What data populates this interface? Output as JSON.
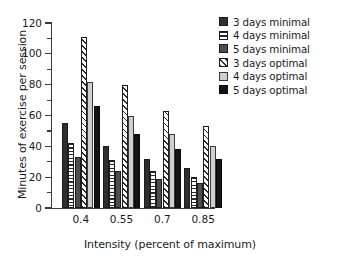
{
  "chart_data": {
    "type": "bar",
    "title": "",
    "xlabel": "Intensity (percent of maximum)",
    "ylabel": "Minutes of exercise per session",
    "categories": [
      "0.4",
      "0.55",
      "0.7",
      "0.85"
    ],
    "ylim": [
      0,
      120
    ],
    "yticks": [
      0,
      20,
      40,
      60,
      80,
      100,
      120
    ],
    "ytick_labels": [
      "0",
      "20",
      "40",
      "60",
      "80",
      "100",
      "120"
    ],
    "y_minor_ticks": [
      10,
      30,
      50,
      70,
      90,
      110
    ],
    "grid": false,
    "legend_position": "top-right",
    "series": [
      {
        "name": "3 days minimal",
        "pattern": "solid-dark-gray",
        "color": "#2f2f2f",
        "values": [
          55,
          40,
          32,
          26
        ]
      },
      {
        "name": "4 days minimal",
        "pattern": "horizontal-stripe",
        "color": "#ffffff",
        "values": [
          42,
          31,
          24,
          20
        ]
      },
      {
        "name": "5 days minimal",
        "pattern": "solid-medium-gray",
        "color": "#4d4d4d",
        "values": [
          33,
          24,
          19,
          16
        ]
      },
      {
        "name": "3 days optimal",
        "pattern": "diagonal-hatch",
        "color": "#ffffff",
        "values": [
          111,
          80,
          63,
          53
        ]
      },
      {
        "name": "4 days optimal",
        "pattern": "solid-light-gray",
        "color": "#cfcfcf",
        "values": [
          82,
          60,
          48,
          40
        ]
      },
      {
        "name": "5 days optimal",
        "pattern": "solid-black",
        "color": "#141414",
        "values": [
          66,
          48,
          38,
          32
        ]
      }
    ]
  },
  "legend": {
    "items": [
      {
        "label": "3 days minimal",
        "swatch": "f-dark",
        "icon": "legend-swatch-solid-dark-icon"
      },
      {
        "label": "4 days minimal",
        "swatch": "f-hstripe",
        "icon": "legend-swatch-horizontal-stripe-icon"
      },
      {
        "label": "5 days minimal",
        "swatch": "f-medgray",
        "icon": "legend-swatch-medium-gray-icon"
      },
      {
        "label": "3 days optimal",
        "swatch": "f-diagonal",
        "icon": "legend-swatch-diagonal-hatch-icon"
      },
      {
        "label": "4 days optimal",
        "swatch": "f-lightgray",
        "icon": "legend-swatch-light-gray-icon"
      },
      {
        "label": "5 days optimal",
        "swatch": "f-black",
        "icon": "legend-swatch-black-icon"
      }
    ]
  }
}
